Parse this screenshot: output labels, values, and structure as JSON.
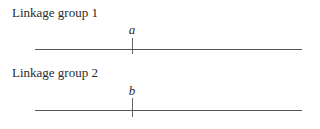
{
  "diagram": {
    "groups": [
      {
        "label": "Linkage group 1",
        "locus": "a"
      },
      {
        "label": "Linkage group 2",
        "locus": "b"
      }
    ],
    "colors": {
      "line": "#555555",
      "text": "#2a2a2a"
    }
  }
}
